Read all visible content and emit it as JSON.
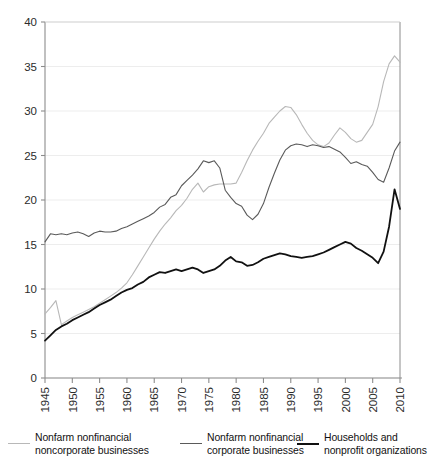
{
  "chart_data": {
    "type": "line",
    "title": "",
    "subtitle": "",
    "xlabel": "",
    "ylabel": "",
    "xlim": [
      1945,
      2010
    ],
    "ylim": [
      0,
      40
    ],
    "xticks": [
      1945,
      1950,
      1955,
      1960,
      1965,
      1970,
      1975,
      1980,
      1985,
      1990,
      1995,
      2000,
      2005,
      2010
    ],
    "yticks": [
      0,
      5,
      10,
      15,
      20,
      25,
      30,
      35,
      40
    ],
    "grid": "horizontal",
    "legend_position": "below",
    "x": [
      1945,
      1946,
      1947,
      1948,
      1949,
      1950,
      1951,
      1952,
      1953,
      1954,
      1955,
      1956,
      1957,
      1958,
      1959,
      1960,
      1961,
      1962,
      1963,
      1964,
      1965,
      1966,
      1967,
      1968,
      1969,
      1970,
      1971,
      1972,
      1973,
      1974,
      1975,
      1976,
      1977,
      1978,
      1979,
      1980,
      1981,
      1982,
      1983,
      1984,
      1985,
      1986,
      1987,
      1988,
      1989,
      1990,
      1991,
      1992,
      1993,
      1994,
      1995,
      1996,
      1997,
      1998,
      1999,
      2000,
      2001,
      2002,
      2003,
      2004,
      2005,
      2006,
      2007,
      2008,
      2009,
      2010
    ],
    "series": [
      {
        "name": "Nonfarm nonfinancial noncorporate businesses",
        "color": "#b8b8b8",
        "width": 1.1,
        "values": [
          7.2,
          7.9,
          8.7,
          6.0,
          6.4,
          6.8,
          7.1,
          7.4,
          7.7,
          8.0,
          8.4,
          8.8,
          9.2,
          9.6,
          10.1,
          10.7,
          11.6,
          12.6,
          13.6,
          14.6,
          15.6,
          16.5,
          17.3,
          18.0,
          18.8,
          19.4,
          20.2,
          21.2,
          21.9,
          20.9,
          21.5,
          21.7,
          21.8,
          21.8,
          21.8,
          21.9,
          23.1,
          24.4,
          25.6,
          26.6,
          27.5,
          28.6,
          29.3,
          30.0,
          30.5,
          30.4,
          29.6,
          28.5,
          27.5,
          26.7,
          26.2,
          26.0,
          26.4,
          27.3,
          28.1,
          27.6,
          26.9,
          26.5,
          26.7,
          27.6,
          28.5,
          30.5,
          33.3,
          35.3,
          36.2,
          35.5
        ]
      },
      {
        "name": "Nonfarm nonfinancial corporate businesses",
        "color": "#5a5a5a",
        "width": 1.1,
        "values": [
          15.3,
          16.2,
          16.1,
          16.2,
          16.1,
          16.3,
          16.4,
          16.2,
          15.9,
          16.3,
          16.5,
          16.4,
          16.4,
          16.5,
          16.8,
          17.0,
          17.3,
          17.6,
          17.9,
          18.2,
          18.6,
          19.2,
          19.5,
          20.3,
          20.6,
          21.6,
          22.2,
          22.8,
          23.5,
          24.4,
          24.2,
          24.4,
          23.6,
          21.1,
          20.3,
          19.6,
          19.3,
          18.3,
          17.8,
          18.4,
          19.6,
          21.4,
          23.0,
          24.5,
          25.6,
          26.1,
          26.3,
          26.2,
          26.0,
          26.2,
          26.1,
          25.9,
          26.0,
          25.7,
          25.4,
          24.8,
          24.1,
          24.3,
          24.0,
          23.8,
          23.1,
          22.3,
          22.0,
          23.6,
          25.5,
          26.5
        ]
      },
      {
        "name": "Households and nonprofit organizations",
        "color": "#111111",
        "width": 1.8,
        "values": [
          4.2,
          4.8,
          5.4,
          5.8,
          6.1,
          6.5,
          6.8,
          7.1,
          7.4,
          7.8,
          8.2,
          8.5,
          8.8,
          9.2,
          9.6,
          9.9,
          10.1,
          10.5,
          10.8,
          11.3,
          11.6,
          11.9,
          11.8,
          12.0,
          12.2,
          12.0,
          12.2,
          12.4,
          12.2,
          11.8,
          12.0,
          12.2,
          12.6,
          13.2,
          13.6,
          13.1,
          13.0,
          12.6,
          12.7,
          13.0,
          13.4,
          13.6,
          13.8,
          14.0,
          13.9,
          13.7,
          13.6,
          13.5,
          13.6,
          13.7,
          13.9,
          14.1,
          14.4,
          14.7,
          15.0,
          15.3,
          15.1,
          14.6,
          14.3,
          13.9,
          13.5,
          12.9,
          14.2,
          17.0,
          21.2,
          19.0
        ]
      }
    ]
  },
  "axis": {
    "y_tick_labels": [
      "0",
      "5",
      "10",
      "15",
      "20",
      "25",
      "30",
      "35",
      "40"
    ],
    "x_tick_labels": [
      "1945",
      "1950",
      "1955",
      "1960",
      "1965",
      "1970",
      "1975",
      "1980",
      "1985",
      "1990",
      "1995",
      "2000",
      "2005",
      "2010"
    ]
  },
  "legend": {
    "items": [
      {
        "label": "Nonfarm nonfinancial\nnoncorporate businesses",
        "color": "#b8b8b8",
        "thickness": "1.4px"
      },
      {
        "label": "Nonfarm nonfinancial\ncorporate businesses",
        "color": "#5a5a5a",
        "thickness": "1.6px"
      },
      {
        "label": "Households and\nnonprofit organizations",
        "color": "#111111",
        "thickness": "2.4px"
      }
    ]
  }
}
